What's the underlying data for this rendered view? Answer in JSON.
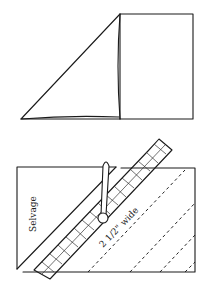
{
  "figure_top": {
    "description": "Fabric square with one corner folded diagonally to form a triangle"
  },
  "figure_bottom": {
    "selvage_label": "Selvage",
    "strip_width_label": "2 1/2\" wide",
    "ruler_grid_cells": 14,
    "dashed_cut_lines": 3
  }
}
